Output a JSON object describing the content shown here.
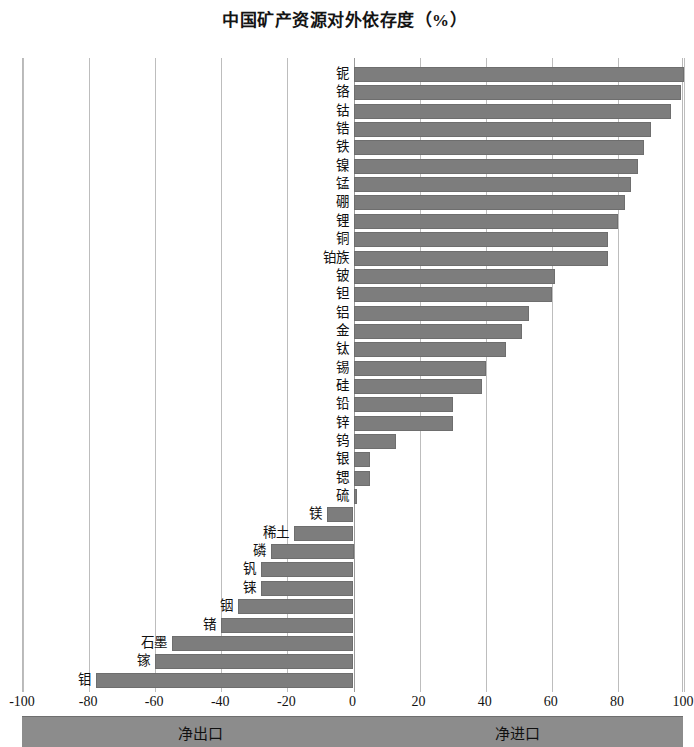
{
  "chart_data": {
    "type": "bar",
    "orientation": "horizontal",
    "title": "中国矿产资源对外依存度（%）",
    "xlabel": "",
    "ylabel": "",
    "xlim": [
      -100,
      100
    ],
    "xticks": [
      -100,
      -80,
      -60,
      -40,
      -20,
      0,
      20,
      40,
      60,
      80,
      100
    ],
    "xtick_labels": [
      "-100",
      "-80",
      "-60",
      "-40",
      "-20",
      "0",
      "20",
      "40",
      "60",
      "80",
      "100"
    ],
    "grid": true,
    "legend": null,
    "bar_color": "#7d7d7d",
    "categories": [
      "铌",
      "铬",
      "钴",
      "锆",
      "铁",
      "镍",
      "锰",
      "硼",
      "锂",
      "铜",
      "铂族",
      "铍",
      "钽",
      "铝",
      "金",
      "钛",
      "锡",
      "硅",
      "铅",
      "锌",
      "钨",
      "银",
      "锶",
      "硫",
      "镁",
      "稀土",
      "磷",
      "钒",
      "铼",
      "铟",
      "锗",
      "石墨",
      "镓",
      "钼"
    ],
    "values": [
      100,
      99,
      96,
      90,
      88,
      86,
      84,
      82,
      80,
      77,
      77,
      61,
      60,
      53,
      51,
      46,
      40,
      39,
      30,
      30,
      13,
      5,
      5,
      1,
      -8,
      -18,
      -25,
      -28,
      -28,
      -35,
      -40,
      -55,
      -60,
      -78
    ],
    "annotations": {
      "left_band": "净出口",
      "right_band": "净进口"
    }
  },
  "footer": {
    "net_export": "净出口",
    "net_import": "净进口"
  }
}
